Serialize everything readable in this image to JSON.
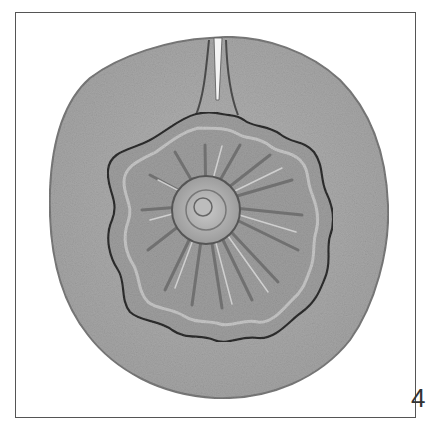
{
  "figure": {
    "panel_label": "4",
    "colors": {
      "background": "#ffffff",
      "frame": "#555555",
      "disc": "#a9a9a9",
      "disc_edge": "#6e6e6e",
      "fossil": "#9a9a9a",
      "fossil_outline": "#2e2e2e",
      "highlight": "#d4d4d4"
    }
  }
}
